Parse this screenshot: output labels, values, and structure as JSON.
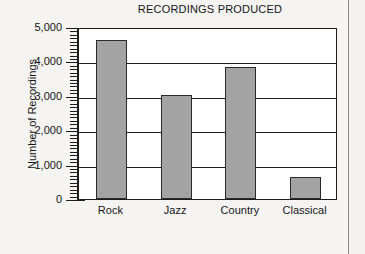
{
  "chart_data": {
    "type": "bar",
    "title": "RECORDINGS PRODUCED",
    "xlabel": "",
    "ylabel": "Number of Recordings",
    "categories": [
      "Rock",
      "Jazz",
      "Country",
      "Classical"
    ],
    "values": [
      4620,
      3020,
      3840,
      640
    ],
    "ylim": [
      0,
      5000
    ],
    "yticks": [
      0,
      1000,
      2000,
      3000,
      4000,
      5000
    ],
    "ytick_labels": [
      "0",
      "1,000",
      "2,000",
      "3,000",
      "4,000",
      "5,000"
    ],
    "minor_tick_step": 100,
    "grid": true,
    "grid_axis": "y",
    "legend": null,
    "bar_color": "#a3a3a3",
    "bar_edge_color": "#2a2a2a",
    "axis_color": "#1c1c1c",
    "plot_background": "#ffffff",
    "figure_background": "#f5f4f2"
  }
}
